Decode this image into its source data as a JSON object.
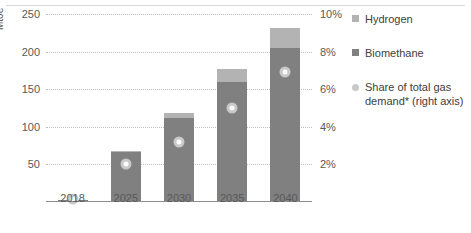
{
  "chart_data": {
    "type": "bar",
    "title": "",
    "xlabel": "",
    "ylabel": "Mtoe",
    "categories": [
      "2018",
      "2025",
      "2030",
      "2035",
      "2040"
    ],
    "ylim": [
      0,
      250
    ],
    "yticks": [
      "50",
      "100",
      "150",
      "200",
      "250"
    ],
    "ytick_values": [
      50,
      100,
      150,
      200,
      250
    ],
    "y2label": "",
    "y2lim": [
      0,
      10
    ],
    "y2ticks": [
      "2%",
      "4%",
      "6%",
      "8%",
      "10%"
    ],
    "y2tick_values": [
      2,
      4,
      6,
      8,
      10
    ],
    "grid": true,
    "legend_position": "right",
    "series": [
      {
        "name": "Biomethane",
        "type": "bar",
        "stack": "total",
        "color": "#808080",
        "values": [
          3,
          66,
          112,
          160,
          205
        ]
      },
      {
        "name": "Hydrogen",
        "type": "bar",
        "stack": "total",
        "color": "#b3b3b3",
        "values": [
          0,
          2,
          6,
          17,
          27
        ]
      },
      {
        "name": "Share of total gas demand* (right axis)",
        "type": "scatter",
        "axis": "right",
        "color": "#c9c9c9",
        "values": [
          0.15,
          2.0,
          3.2,
          5.0,
          6.9
        ]
      }
    ]
  },
  "axes": {
    "y_title": "Mtoe",
    "y_ticks": [
      "250",
      "200",
      "150",
      "100",
      "50"
    ],
    "y2_ticks": [
      "10%",
      "8%",
      "6%",
      "4%",
      "2%"
    ],
    "x_ticks": [
      "2018",
      "2025",
      "2030",
      "2035",
      "2040"
    ]
  },
  "legend": {
    "items": [
      {
        "label": "Hydrogen",
        "marker": "square",
        "color": "#b3b3b3"
      },
      {
        "label": "Biomethane",
        "marker": "square",
        "color": "#808080"
      },
      {
        "label": "Share of total gas demand* (right axis)",
        "marker": "circle",
        "color": "#c9c9c9"
      }
    ]
  },
  "colors": {
    "hydrogen": "#b3b3b3",
    "biomethane": "#808080",
    "marker": "#c9c9c9",
    "grid": "#bfbfbf",
    "axis": "#8c8c8c",
    "text": "#595959"
  }
}
